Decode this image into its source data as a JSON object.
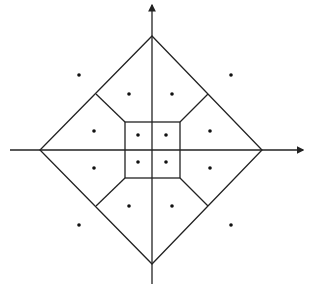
{
  "diagram": {
    "type": "voronoi-partition",
    "colors": {
      "stroke": "#222222",
      "point": "#111111",
      "background": "#ffffff"
    },
    "axes": {
      "origin": [
        152,
        150
      ],
      "x_axis": {
        "from": [
          10,
          150
        ],
        "to": [
          303,
          150
        ],
        "arrow": true
      },
      "y_axis": {
        "from": [
          152,
          284
        ],
        "to": [
          152,
          5
        ],
        "arrow": true
      }
    },
    "outer_boundary": {
      "shape": "diamond",
      "vertices": [
        [
          152,
          36
        ],
        [
          262,
          150
        ],
        [
          152,
          264
        ],
        [
          40,
          150
        ]
      ]
    },
    "inner_square": {
      "x1": 125,
      "y1": 122,
      "x2": 180,
      "y2": 178
    },
    "cell_edges": [
      [
        [
          96,
          94
        ],
        [
          125,
          122
        ]
      ],
      [
        [
          208,
          94
        ],
        [
          180,
          122
        ]
      ],
      [
        [
          96,
          206
        ],
        [
          125,
          178
        ]
      ],
      [
        [
          208,
          206
        ],
        [
          180,
          178
        ]
      ]
    ],
    "points": {
      "outer": [
        [
          79,
          75
        ],
        [
          231,
          75
        ],
        [
          79,
          225
        ],
        [
          231,
          225
        ]
      ],
      "middle": [
        [
          129,
          94
        ],
        [
          172,
          94
        ],
        [
          94,
          131
        ],
        [
          210,
          131
        ],
        [
          94,
          168
        ],
        [
          210,
          168
        ],
        [
          129,
          206
        ],
        [
          172,
          206
        ]
      ],
      "inner": [
        [
          138,
          135
        ],
        [
          166,
          135
        ],
        [
          138,
          162
        ],
        [
          166,
          162
        ]
      ]
    }
  }
}
